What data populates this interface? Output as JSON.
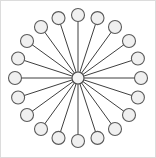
{
  "figure": {
    "title": "Star graph",
    "canvas": {
      "width": 156,
      "height": 158,
      "background": "#ffffff"
    },
    "border": {
      "visible": true,
      "color": "#dcdcdc",
      "width": 1
    }
  },
  "chart_data": {
    "type": "scatter",
    "title": "Star graph",
    "xlabel": "",
    "ylabel": "",
    "layout": "radial",
    "center": {
      "x": 78,
      "y": 78
    },
    "radius": 63,
    "node_count": 21,
    "leaf_count": 20,
    "edge_count": 20,
    "angle_step_degrees": 18,
    "start_angle_degrees": 90,
    "hub": {
      "id": "hub",
      "x": 78,
      "y": 78,
      "r": 6,
      "fill": "#f4f4f4",
      "stroke": "#4a4a4a"
    },
    "leaf_style": {
      "r": 6.5,
      "fill": "#f0f0f0",
      "stroke": "#5a5a5a"
    },
    "edge_style": {
      "stroke": "#3f3f3f",
      "width": 1
    },
    "nodes": [
      {
        "id": "n1",
        "angle": 90,
        "x": 78.0,
        "y": 15.0
      },
      {
        "id": "n2",
        "angle": 72,
        "x": 97.5,
        "y": 18.1
      },
      {
        "id": "n3",
        "angle": 54,
        "x": 115.0,
        "y": 27.0
      },
      {
        "id": "n4",
        "angle": 36,
        "x": 129.0,
        "y": 41.0
      },
      {
        "id": "n5",
        "angle": 18,
        "x": 137.9,
        "y": 58.5
      },
      {
        "id": "n6",
        "angle": 0,
        "x": 141.0,
        "y": 78.0
      },
      {
        "id": "n7",
        "angle": 342,
        "x": 137.9,
        "y": 97.5
      },
      {
        "id": "n8",
        "angle": 324,
        "x": 129.0,
        "y": 115.0
      },
      {
        "id": "n9",
        "angle": 306,
        "x": 115.0,
        "y": 129.0
      },
      {
        "id": "n10",
        "angle": 288,
        "x": 97.5,
        "y": 137.9
      },
      {
        "id": "n11",
        "angle": 270,
        "x": 78.0,
        "y": 141.0
      },
      {
        "id": "n12",
        "angle": 252,
        "x": 58.5,
        "y": 137.9
      },
      {
        "id": "n13",
        "angle": 234,
        "x": 41.0,
        "y": 129.0
      },
      {
        "id": "n14",
        "angle": 216,
        "x": 27.0,
        "y": 115.0
      },
      {
        "id": "n15",
        "angle": 198,
        "x": 18.1,
        "y": 97.5
      },
      {
        "id": "n16",
        "angle": 180,
        "x": 15.0,
        "y": 78.0
      },
      {
        "id": "n17",
        "angle": 162,
        "x": 18.1,
        "y": 58.5
      },
      {
        "id": "n18",
        "angle": 144,
        "x": 27.0,
        "y": 41.0
      },
      {
        "id": "n19",
        "angle": 126,
        "x": 41.0,
        "y": 27.0
      },
      {
        "id": "n20",
        "angle": 108,
        "x": 58.5,
        "y": 18.1
      }
    ],
    "edges": [
      {
        "from": "hub",
        "to": "n1"
      },
      {
        "from": "hub",
        "to": "n2"
      },
      {
        "from": "hub",
        "to": "n3"
      },
      {
        "from": "hub",
        "to": "n4"
      },
      {
        "from": "hub",
        "to": "n5"
      },
      {
        "from": "hub",
        "to": "n6"
      },
      {
        "from": "hub",
        "to": "n7"
      },
      {
        "from": "hub",
        "to": "n8"
      },
      {
        "from": "hub",
        "to": "n9"
      },
      {
        "from": "hub",
        "to": "n10"
      },
      {
        "from": "hub",
        "to": "n11"
      },
      {
        "from": "hub",
        "to": "n12"
      },
      {
        "from": "hub",
        "to": "n13"
      },
      {
        "from": "hub",
        "to": "n14"
      },
      {
        "from": "hub",
        "to": "n15"
      },
      {
        "from": "hub",
        "to": "n16"
      },
      {
        "from": "hub",
        "to": "n17"
      },
      {
        "from": "hub",
        "to": "n18"
      },
      {
        "from": "hub",
        "to": "n19"
      },
      {
        "from": "hub",
        "to": "n20"
      }
    ]
  }
}
